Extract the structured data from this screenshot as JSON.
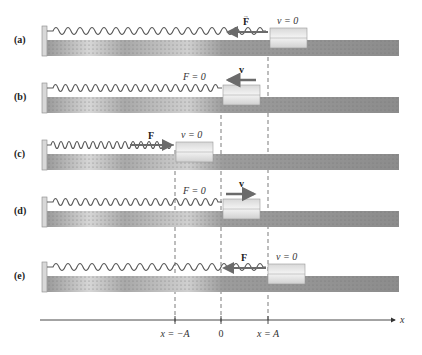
{
  "figure": {
    "colors": {
      "track_dark": "#8a8a8a",
      "track_light": "#d0d0d0",
      "block": "#e4e4e4",
      "spring": "#5a5a5a",
      "arrow": "#6b6b6b",
      "axis": "#333333"
    },
    "positions": {
      "neg_A_x": 175,
      "zero_x": 221,
      "pos_A_x": 268
    },
    "rows": [
      {
        "id": "a",
        "label": "(a)",
        "state_text": "v = 0",
        "vector": "F",
        "vector_dir": "left",
        "block_x": 268
      },
      {
        "id": "b",
        "label": "(b)",
        "state_text": "F = 0",
        "vector": "v",
        "vector_dir": "left",
        "block_x": 221
      },
      {
        "id": "c",
        "label": "(c)",
        "state_text": "v = 0",
        "vector": "F",
        "vector_dir": "right",
        "block_x": 175
      },
      {
        "id": "d",
        "label": "(d)",
        "state_text": "F = 0",
        "vector": "v",
        "vector_dir": "right",
        "block_x": 221
      },
      {
        "id": "e",
        "label": "(e)",
        "state_text": "v = 0",
        "vector": "F",
        "vector_dir": "left",
        "block_x": 268
      }
    ],
    "axis": {
      "label": "x",
      "ticks": [
        {
          "label": "x = −A",
          "x": 175
        },
        {
          "label": "0",
          "x": 221
        },
        {
          "label": "x = A",
          "x": 268
        }
      ]
    }
  }
}
